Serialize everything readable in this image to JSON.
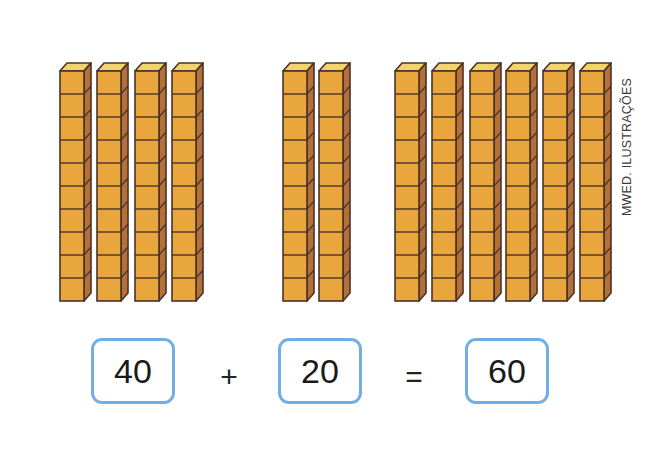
{
  "figure": {
    "credit": "MWED. ILUSTRAÇÕES",
    "rod_colors": {
      "front": "#e9a63c",
      "side": "#b5703a",
      "top": "#f3d46a",
      "outline": "#4a3328"
    },
    "cubes_per_rod": 10,
    "groups": [
      {
        "name": "group-40",
        "rods": 4,
        "x": [
          59,
          96,
          134,
          171
        ]
      },
      {
        "name": "group-20",
        "rods": 2,
        "x": [
          282,
          318
        ]
      },
      {
        "name": "group-60",
        "rods": 6,
        "x": [
          394,
          431,
          469,
          505,
          542,
          579
        ]
      }
    ]
  },
  "equation": {
    "addend1": "40",
    "plus": "+",
    "addend2": "20",
    "equals": "=",
    "sum": "60",
    "box_border_color": "#72aee6"
  }
}
